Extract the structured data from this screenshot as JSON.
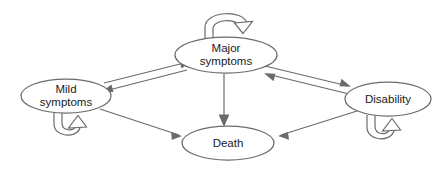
{
  "diagram": {
    "type": "state-transition",
    "background_color": "#ffffff",
    "stroke_color": "#6b6b6b",
    "text_color": "#1a1a1a",
    "arrowhead_fill_solid": "#6b6b6b",
    "arrowhead_fill_hollow": "#ffffff",
    "nodes": [
      {
        "id": "mild",
        "label_line1": "Mild",
        "label_line2": "symptoms",
        "shape": "ellipse",
        "cx": 66,
        "cy": 96,
        "rx": 45,
        "ry": 17
      },
      {
        "id": "major",
        "label_line1": "Major",
        "label_line2": "symptoms",
        "shape": "ellipse",
        "cx": 226,
        "cy": 55,
        "rx": 51,
        "ry": 18
      },
      {
        "id": "disability",
        "label_line1": "Disability",
        "label_line2": "",
        "shape": "ellipse",
        "cx": 388,
        "cy": 99,
        "rx": 43,
        "ry": 17
      },
      {
        "id": "death",
        "label_line1": "Death",
        "label_line2": "",
        "shape": "ellipse",
        "cx": 228,
        "cy": 143,
        "rx": 46,
        "ry": 17
      }
    ],
    "edges": [
      {
        "id": "mild-to-major",
        "from": "mild",
        "to": "major",
        "style": "solid-arrowhead",
        "direction": "forward"
      },
      {
        "id": "major-to-mild",
        "from": "major",
        "to": "mild",
        "style": "solid-arrowhead",
        "direction": "forward"
      },
      {
        "id": "major-to-disability",
        "from": "major",
        "to": "disability",
        "style": "solid-arrowhead",
        "direction": "forward"
      },
      {
        "id": "disability-to-major",
        "from": "disability",
        "to": "major",
        "style": "solid-arrowhead",
        "direction": "forward"
      },
      {
        "id": "mild-to-death",
        "from": "mild",
        "to": "death",
        "style": "solid-arrowhead",
        "direction": "forward"
      },
      {
        "id": "major-to-death",
        "from": "major",
        "to": "death",
        "style": "solid-arrowhead",
        "direction": "forward"
      },
      {
        "id": "disability-to-death",
        "from": "disability",
        "to": "death",
        "style": "solid-arrowhead",
        "direction": "forward"
      }
    ],
    "self_loops": [
      {
        "id": "mild-self-loop",
        "node": "mild",
        "position": "below",
        "style": "hollow-arrowhead"
      },
      {
        "id": "major-self-loop",
        "node": "major",
        "position": "above",
        "style": "hollow-arrowhead"
      },
      {
        "id": "disability-self-loop",
        "node": "disability",
        "position": "below",
        "style": "hollow-arrowhead"
      }
    ]
  }
}
